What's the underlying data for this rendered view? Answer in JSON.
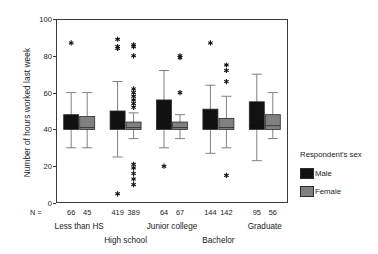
{
  "chart_data": {
    "type": "box",
    "title": "",
    "xlabel": "",
    "ylabel": "Number of hours worked last week",
    "ylim": [
      0,
      100
    ],
    "yticks": [
      0,
      20,
      40,
      60,
      80,
      100
    ],
    "ytick_labels": [
      "0",
      "20",
      "40",
      "60",
      "80",
      "100"
    ],
    "grid": false,
    "legend_position": "right",
    "legend_title": "Respondent's sex",
    "n_prefix": "N =",
    "categories": [
      "Less than HS",
      "High school",
      "Junior college",
      "Bachelor",
      "Graduate"
    ],
    "series": [
      {
        "name": "Male",
        "color": "#111111",
        "boxes": [
          {
            "category": "Less than HS",
            "n": 66,
            "whisker_low": 30,
            "q1": 40,
            "median": 42,
            "q3": 48,
            "whisker_high": 60,
            "outliers": [
              87
            ]
          },
          {
            "category": "High school",
            "n": 419,
            "whisker_low": 25,
            "q1": 40,
            "median": 42,
            "q3": 50,
            "whisker_high": 66,
            "outliers": [
              5,
              84,
              85,
              89
            ]
          },
          {
            "category": "Junior college",
            "n": 64,
            "whisker_low": 30,
            "q1": 40,
            "median": 42,
            "q3": 56,
            "whisker_high": 72,
            "outliers": [
              20
            ]
          },
          {
            "category": "Bachelor",
            "n": 144,
            "whisker_low": 27,
            "q1": 40,
            "median": 42,
            "q3": 51,
            "whisker_high": 64,
            "outliers": [
              87
            ]
          },
          {
            "category": "Graduate",
            "n": 95,
            "whisker_low": 23,
            "q1": 40,
            "median": 42,
            "q3": 55,
            "whisker_high": 70,
            "outliers": []
          }
        ]
      },
      {
        "name": "Female",
        "color": "#808080",
        "boxes": [
          {
            "category": "Less than HS",
            "n": 45,
            "whisker_low": 30,
            "q1": 40,
            "median": 41,
            "q3": 47,
            "whisker_high": 60,
            "outliers": []
          },
          {
            "category": "High school",
            "n": 389,
            "whisker_low": 35,
            "q1": 40,
            "median": 41,
            "q3": 44,
            "whisker_high": 49,
            "outliers": [
              10,
              13,
              16,
              19,
              21,
              52,
              54,
              56,
              58,
              60,
              62,
              80,
              85,
              86
            ]
          },
          {
            "category": "Junior college",
            "n": 67,
            "whisker_low": 35,
            "q1": 40,
            "median": 41,
            "q3": 44,
            "whisker_high": 48,
            "outliers": [
              60,
              79,
              80
            ]
          },
          {
            "category": "Bachelor",
            "n": 142,
            "whisker_low": 30,
            "q1": 40,
            "median": 41,
            "q3": 46,
            "whisker_high": 58,
            "outliers": [
              15,
              66,
              72,
              75
            ]
          },
          {
            "category": "Graduate",
            "n": 56,
            "whisker_low": 35,
            "q1": 40,
            "median": 42,
            "q3": 48,
            "whisker_high": 60,
            "outliers": []
          }
        ]
      }
    ]
  },
  "legend": {
    "title": "Respondent's sex",
    "items": [
      {
        "label": "Male",
        "color": "#111111"
      },
      {
        "label": "Female",
        "color": "#808080"
      }
    ]
  }
}
